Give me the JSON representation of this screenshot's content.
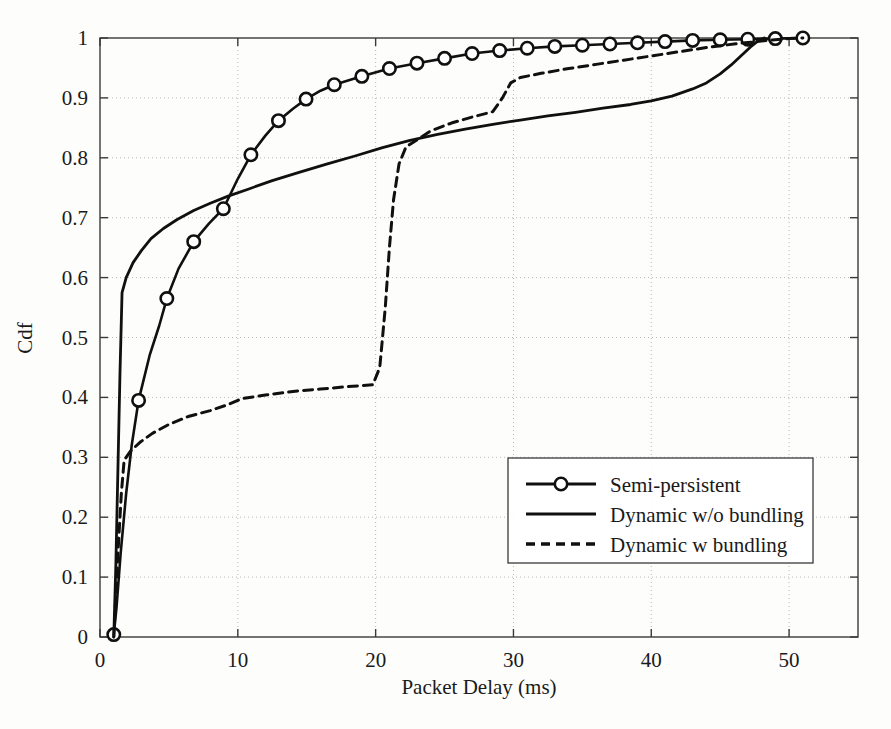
{
  "figure": {
    "background_color": "#fdfdfc",
    "foreground_color": "#101010"
  },
  "chart_data": {
    "type": "line",
    "title": "",
    "xlabel": "Packet Delay (ms)",
    "ylabel": "Cdf",
    "xlim": [
      0,
      55
    ],
    "ylim": [
      0,
      1
    ],
    "xticks": [
      0,
      10,
      20,
      30,
      40,
      50
    ],
    "xtick_labels": [
      "0",
      "10",
      "20",
      "30",
      "40",
      "50"
    ],
    "yticks": [
      0,
      0.1,
      0.2,
      0.3,
      0.4,
      0.5,
      0.6,
      0.7,
      0.8,
      0.9,
      1
    ],
    "ytick_labels": [
      "0",
      "0.1",
      "0.2",
      "0.3",
      "0.4",
      "0.5",
      "0.6",
      "0.7",
      "0.8",
      "0.9",
      "1"
    ],
    "grid": true,
    "legend_position": "center-right",
    "series": [
      {
        "name": "Semi-persistent",
        "style": "solid-with-circle-markers",
        "marker": "circle",
        "color": "#101010",
        "line_width": 2.6,
        "points": [
          [
            1.0,
            0.004
          ],
          [
            1.2,
            0.05
          ],
          [
            1.5,
            0.14
          ],
          [
            1.9,
            0.24
          ],
          [
            2.3,
            0.32
          ],
          [
            2.8,
            0.395
          ],
          [
            3.6,
            0.47
          ],
          [
            4.3,
            0.52
          ],
          [
            4.85,
            0.565
          ],
          [
            5.7,
            0.615
          ],
          [
            6.8,
            0.66
          ],
          [
            7.9,
            0.69
          ],
          [
            8.95,
            0.715
          ],
          [
            10.0,
            0.765
          ],
          [
            10.95,
            0.805
          ],
          [
            12.0,
            0.837
          ],
          [
            12.95,
            0.862
          ],
          [
            14.0,
            0.882
          ],
          [
            14.95,
            0.898
          ],
          [
            16.0,
            0.912
          ],
          [
            17.0,
            0.922
          ],
          [
            19.0,
            0.936
          ],
          [
            21.0,
            0.949
          ],
          [
            23.0,
            0.958
          ],
          [
            25.0,
            0.966
          ],
          [
            27.0,
            0.974
          ],
          [
            29.0,
            0.979
          ],
          [
            31.0,
            0.983
          ],
          [
            33.0,
            0.986
          ],
          [
            35.0,
            0.988
          ],
          [
            37.0,
            0.99
          ],
          [
            39.0,
            0.992
          ],
          [
            41.0,
            0.994
          ],
          [
            43.0,
            0.996
          ],
          [
            45.0,
            0.997
          ],
          [
            47.0,
            0.998
          ],
          [
            49.0,
            0.999
          ],
          [
            51.0,
            1.0
          ]
        ],
        "marker_points": [
          [
            1.0,
            0.004
          ],
          [
            2.8,
            0.395
          ],
          [
            4.85,
            0.565
          ],
          [
            6.8,
            0.66
          ],
          [
            8.95,
            0.715
          ],
          [
            10.95,
            0.805
          ],
          [
            12.95,
            0.862
          ],
          [
            14.95,
            0.898
          ],
          [
            17.0,
            0.922
          ],
          [
            19.0,
            0.936
          ],
          [
            21.0,
            0.949
          ],
          [
            23.0,
            0.958
          ],
          [
            25.0,
            0.966
          ],
          [
            27.0,
            0.974
          ],
          [
            29.0,
            0.979
          ],
          [
            31.0,
            0.983
          ],
          [
            33.0,
            0.986
          ],
          [
            35.0,
            0.988
          ],
          [
            37.0,
            0.99
          ],
          [
            39.0,
            0.992
          ],
          [
            41.0,
            0.994
          ],
          [
            43.0,
            0.996
          ],
          [
            45.0,
            0.997
          ],
          [
            47.0,
            0.998
          ],
          [
            49.0,
            0.999
          ],
          [
            51.0,
            1.0
          ]
        ]
      },
      {
        "name": "Dynamic w/o bundling",
        "style": "solid",
        "marker": "none",
        "color": "#101010",
        "line_width": 2.8,
        "points": [
          [
            1.0,
            0.0
          ],
          [
            1.15,
            0.12
          ],
          [
            1.3,
            0.28
          ],
          [
            1.45,
            0.44
          ],
          [
            1.6,
            0.575
          ],
          [
            1.9,
            0.6
          ],
          [
            2.4,
            0.625
          ],
          [
            3.0,
            0.645
          ],
          [
            3.7,
            0.665
          ],
          [
            4.6,
            0.682
          ],
          [
            5.6,
            0.697
          ],
          [
            6.8,
            0.712
          ],
          [
            8.0,
            0.724
          ],
          [
            9.3,
            0.736
          ],
          [
            10.8,
            0.748
          ],
          [
            12.5,
            0.762
          ],
          [
            14.5,
            0.776
          ],
          [
            16.5,
            0.79
          ],
          [
            18.5,
            0.803
          ],
          [
            20.5,
            0.817
          ],
          [
            22.5,
            0.829
          ],
          [
            24.5,
            0.839
          ],
          [
            26.5,
            0.848
          ],
          [
            28.5,
            0.856
          ],
          [
            30.5,
            0.863
          ],
          [
            32.5,
            0.87
          ],
          [
            34.5,
            0.876
          ],
          [
            36.5,
            0.883
          ],
          [
            38.5,
            0.889
          ],
          [
            40.0,
            0.895
          ],
          [
            41.5,
            0.903
          ],
          [
            43.0,
            0.915
          ],
          [
            44.0,
            0.925
          ],
          [
            45.0,
            0.94
          ],
          [
            45.8,
            0.955
          ],
          [
            46.5,
            0.97
          ],
          [
            47.2,
            0.985
          ],
          [
            47.8,
            0.996
          ],
          [
            48.2,
            1.0
          ]
        ]
      },
      {
        "name": "Dynamic w bundling",
        "style": "dashed",
        "marker": "none",
        "color": "#101010",
        "line_width": 3.0,
        "dash_pattern": "9 6",
        "points": [
          [
            1.0,
            0.0
          ],
          [
            1.15,
            0.07
          ],
          [
            1.35,
            0.16
          ],
          [
            1.55,
            0.24
          ],
          [
            1.75,
            0.295
          ],
          [
            2.2,
            0.31
          ],
          [
            2.9,
            0.325
          ],
          [
            3.8,
            0.34
          ],
          [
            5.0,
            0.355
          ],
          [
            6.4,
            0.368
          ],
          [
            8.0,
            0.378
          ],
          [
            9.3,
            0.388
          ],
          [
            10.3,
            0.398
          ],
          [
            12.0,
            0.404
          ],
          [
            14.0,
            0.41
          ],
          [
            16.0,
            0.414
          ],
          [
            18.0,
            0.418
          ],
          [
            19.8,
            0.421
          ],
          [
            20.3,
            0.45
          ],
          [
            20.7,
            0.55
          ],
          [
            21.0,
            0.65
          ],
          [
            21.3,
            0.73
          ],
          [
            21.7,
            0.79
          ],
          [
            22.2,
            0.818
          ],
          [
            23.0,
            0.83
          ],
          [
            24.0,
            0.845
          ],
          [
            25.5,
            0.858
          ],
          [
            27.0,
            0.868
          ],
          [
            28.5,
            0.877
          ],
          [
            29.2,
            0.9
          ],
          [
            29.8,
            0.925
          ],
          [
            30.5,
            0.934
          ],
          [
            32.0,
            0.941
          ],
          [
            34.0,
            0.949
          ],
          [
            36.0,
            0.956
          ],
          [
            38.0,
            0.963
          ],
          [
            40.0,
            0.97
          ],
          [
            42.0,
            0.977
          ],
          [
            44.0,
            0.984
          ],
          [
            46.0,
            0.99
          ],
          [
            48.0,
            0.995
          ],
          [
            50.0,
            0.999
          ],
          [
            51.0,
            1.0
          ]
        ]
      }
    ]
  },
  "legend": {
    "entries": [
      {
        "label": "Semi-persistent",
        "swatch": "line-circle"
      },
      {
        "label": "Dynamic w/o bundling",
        "swatch": "line-solid"
      },
      {
        "label": "Dynamic w bundling",
        "swatch": "line-dashed"
      }
    ]
  }
}
